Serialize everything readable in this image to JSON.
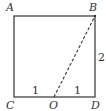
{
  "diagram": {
    "type": "geometry",
    "shape": "square",
    "points": {
      "A": {
        "label": "A"
      },
      "B": {
        "label": "B"
      },
      "C": {
        "label": "C"
      },
      "D": {
        "label": "D"
      },
      "O": {
        "label": "O"
      }
    },
    "measurements": {
      "BD": "2",
      "CO": "1",
      "OD": "1"
    },
    "segments": [
      {
        "from": "A",
        "to": "B",
        "style": "solid"
      },
      {
        "from": "B",
        "to": "D",
        "style": "solid"
      },
      {
        "from": "D",
        "to": "C",
        "style": "solid"
      },
      {
        "from": "C",
        "to": "A",
        "style": "solid"
      },
      {
        "from": "O",
        "to": "B",
        "style": "dashed"
      }
    ],
    "colors": {
      "stroke": "#333333",
      "background": "#ffffff"
    }
  }
}
